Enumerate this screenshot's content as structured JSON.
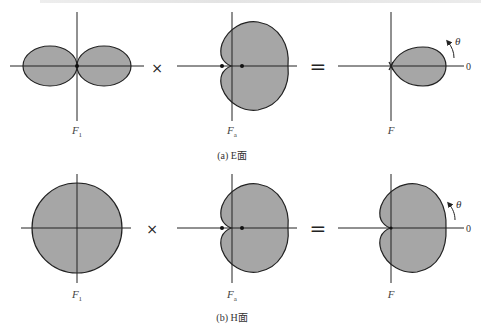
{
  "figure": {
    "top_text_partial": "",
    "operators": {
      "times": "×",
      "equals": "="
    },
    "colors": {
      "fill": "#a6a6a6",
      "stroke": "#222222",
      "axis": "#222222"
    },
    "rows": [
      {
        "caption": "(a) E面",
        "panels": [
          {
            "label_main": "F",
            "label_sub": "1",
            "shape": "figure-eight-dipole"
          },
          {
            "label_main": "F",
            "label_sub": "a",
            "shape": "cardioid"
          },
          {
            "label_main": "F",
            "label_sub": "",
            "shape": "teardrop-main-lobe"
          }
        ],
        "angle_symbol": "θ",
        "zero_label": "0"
      },
      {
        "caption": "(b) H面",
        "panels": [
          {
            "label_main": "F",
            "label_sub": "1",
            "shape": "circle-omnidirectional"
          },
          {
            "label_main": "F",
            "label_sub": "a",
            "shape": "cardioid"
          },
          {
            "label_main": "F",
            "label_sub": "",
            "shape": "cardioid"
          }
        ],
        "angle_symbol": "θ",
        "zero_label": "0"
      }
    ]
  }
}
